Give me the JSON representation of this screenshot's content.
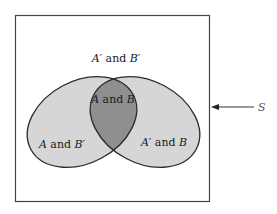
{
  "diagram": {
    "type": "venn",
    "universe_label": "S",
    "regions": {
      "outside": {
        "set_a": "A′",
        "conj": "and",
        "set_b": "B′"
      },
      "a_only": {
        "set_a": "A",
        "conj": "and",
        "set_b": "B′"
      },
      "both": {
        "set_a": "A",
        "conj": "and",
        "set_b": "B"
      },
      "b_only": {
        "set_a": "A′",
        "conj": "and",
        "set_b": "B"
      }
    },
    "colors": {
      "background": "#ffffff",
      "light_fill": "#d6d6d6",
      "dark_fill": "#8f8f8f",
      "stroke": "#2a2a2a"
    }
  }
}
